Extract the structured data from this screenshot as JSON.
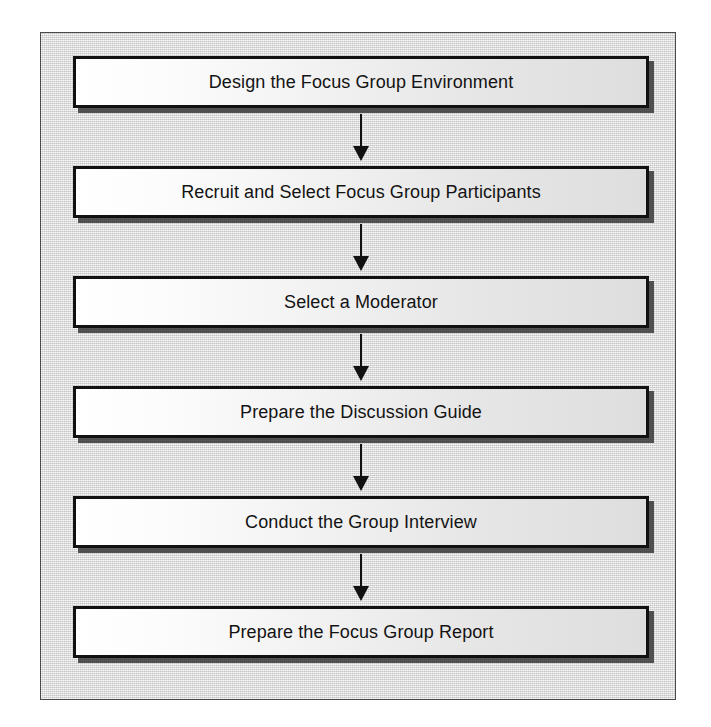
{
  "document": {
    "type": "flowchart",
    "title": "Focus Group Process",
    "orientation": "vertical-top-to-bottom"
  },
  "colors": {
    "panel_background": "#d6d6d6",
    "panel_border": "#4a4a4a",
    "node_border": "#111111",
    "node_fill_start": "#ffffff",
    "node_fill_end": "#dedede",
    "node_shadow": "#282828",
    "text": "#131313",
    "arrow": "#111111",
    "page_background": "#ffffff"
  },
  "flow": {
    "nodes": [
      {
        "id": "step-1",
        "order": 1,
        "label": "Design the Focus Group Environment"
      },
      {
        "id": "step-2",
        "order": 2,
        "label": "Recruit and Select Focus Group Participants"
      },
      {
        "id": "step-3",
        "order": 3,
        "label": "Select a Moderator"
      },
      {
        "id": "step-4",
        "order": 4,
        "label": "Prepare the Discussion Guide"
      },
      {
        "id": "step-5",
        "order": 5,
        "label": "Conduct the Group Interview"
      },
      {
        "id": "step-6",
        "order": 6,
        "label": "Prepare the Focus Group Report"
      }
    ],
    "connectors": [
      {
        "id": "arrow-1",
        "from": "step-1",
        "to": "step-2",
        "icon": "arrow-down-icon"
      },
      {
        "id": "arrow-2",
        "from": "step-2",
        "to": "step-3",
        "icon": "arrow-down-icon"
      },
      {
        "id": "arrow-3",
        "from": "step-3",
        "to": "step-4",
        "icon": "arrow-down-icon"
      },
      {
        "id": "arrow-4",
        "from": "step-4",
        "to": "step-5",
        "icon": "arrow-down-icon"
      },
      {
        "id": "arrow-5",
        "from": "step-5",
        "to": "step-6",
        "icon": "arrow-down-icon"
      }
    ]
  }
}
